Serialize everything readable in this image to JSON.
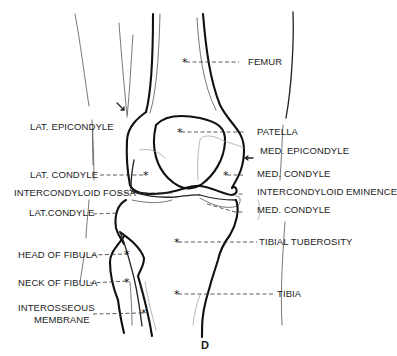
{
  "figure": {
    "caption": "D",
    "labels_left": {
      "lat_epicondyle": "LAT. EPICONDYLE",
      "lat_condyle_femur": "LAT. CONDYLE",
      "intercondyloid_fossa": "INTERCONDYLOID FOSSA",
      "lat_condyle_tibia": "LAT.CONDYLE",
      "head_of_fibula": "HEAD OF FIBULA",
      "neck_of_fibula": "NECK OF FIBULA",
      "interosseous_line1": "INTEROSSEOUS",
      "interosseous_line2": "MEMBRANE"
    },
    "labels_right": {
      "femur": "FEMUR",
      "patella": "PATELLA",
      "med_epicondyle": "MED. EPICONDYLE",
      "med_condyle_femur": "MED. CONDYLE",
      "intercondyloid_eminence": "INTERCONDYLOID EMINENCE",
      "med_condyle_tibia": "MED. CONDYLE",
      "tibial_tuberosity": "TIBIAL TUBEROSITY",
      "tibia": "TIBIA"
    },
    "marker_symbol": "*"
  }
}
